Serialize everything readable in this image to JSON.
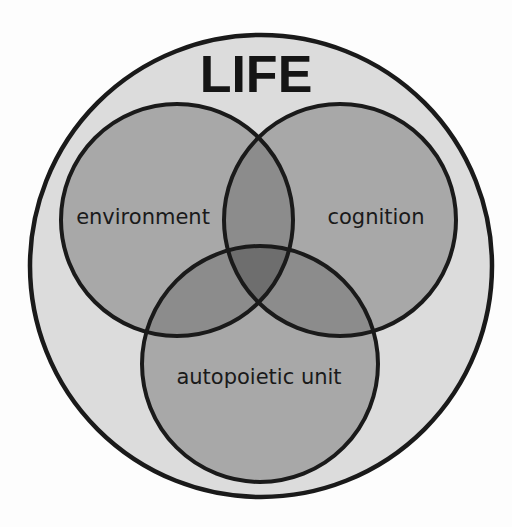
{
  "diagram": {
    "title": "LIFE",
    "type": "venn",
    "sets": [
      {
        "id": "environment",
        "label": "environment"
      },
      {
        "id": "cognition",
        "label": "cognition"
      },
      {
        "id": "autopoietic",
        "label": "autopoietic unit"
      }
    ],
    "colors": {
      "background": "#fdfdfd",
      "outer_fill": "#dcdcdc",
      "single_fill": "#a8a8a8",
      "double_overlap": "#8c8c8c",
      "triple_overlap": "#6e6e6e",
      "stroke": "#1a1a1a"
    }
  }
}
